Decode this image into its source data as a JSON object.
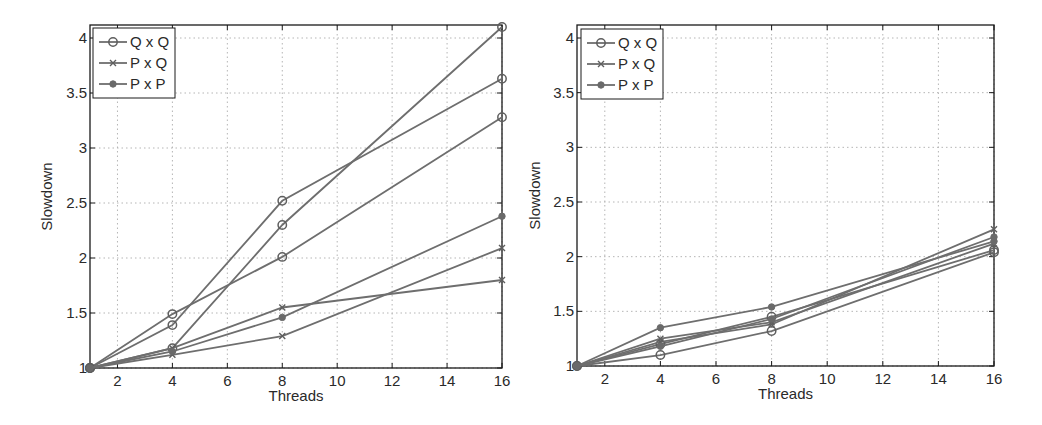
{
  "chart_data": [
    {
      "type": "line",
      "title": "",
      "xlabel": "Threads",
      "ylabel": "Slowdown",
      "xlim": [
        1,
        16
      ],
      "ylim": [
        1,
        4.12
      ],
      "grid": true,
      "legend_position": "upper left",
      "x": [
        1,
        4,
        8,
        16
      ],
      "xticks": [
        2,
        4,
        6,
        8,
        10,
        12,
        14,
        16
      ],
      "yticks": [
        1,
        1.5,
        2,
        2.5,
        3,
        3.5,
        4
      ],
      "xtick_labels": [
        "2",
        "4",
        "6",
        "8",
        "10",
        "12",
        "14",
        "16"
      ],
      "ytick_labels": [
        "1",
        "1.5",
        "2",
        "2.5",
        "3",
        "3.5",
        "4"
      ],
      "legend": [
        {
          "label": "Q x Q",
          "marker": "circle"
        },
        {
          "label": "P x Q",
          "marker": "x"
        },
        {
          "label": "P x P",
          "marker": "dot"
        }
      ],
      "series": [
        {
          "name": "Q x Q",
          "marker": "circle",
          "values": [
            1,
            1.18,
            2.3,
            4.1
          ]
        },
        {
          "name": "Q x Q",
          "marker": "circle",
          "values": [
            1,
            1.39,
            2.52,
            3.63
          ]
        },
        {
          "name": "Q x Q",
          "marker": "circle",
          "values": [
            1,
            1.49,
            2.01,
            3.28
          ]
        },
        {
          "name": "P x Q",
          "marker": "x",
          "values": [
            1,
            1.18,
            1.55,
            1.8
          ]
        },
        {
          "name": "P x Q",
          "marker": "x",
          "values": [
            1,
            1.12,
            1.29,
            2.09
          ]
        },
        {
          "name": "P x P",
          "marker": "dot",
          "values": [
            1,
            1.15,
            1.46,
            2.38
          ]
        }
      ]
    },
    {
      "type": "line",
      "title": "",
      "xlabel": "Threads",
      "ylabel": "Slowdown",
      "xlim": [
        1,
        16
      ],
      "ylim": [
        1,
        4.12
      ],
      "grid": true,
      "legend_position": "upper left",
      "x": [
        1,
        4,
        8,
        16
      ],
      "xticks": [
        2,
        4,
        6,
        8,
        10,
        12,
        14,
        16
      ],
      "yticks": [
        1,
        1.5,
        2,
        2.5,
        3,
        3.5,
        4
      ],
      "xtick_labels": [
        "2",
        "4",
        "6",
        "8",
        "10",
        "12",
        "14",
        "16"
      ],
      "ytick_labels": [
        "1",
        "1.5",
        "2",
        "2.5",
        "3",
        "3.5",
        "4"
      ],
      "legend": [
        {
          "label": "Q x Q",
          "marker": "circle"
        },
        {
          "label": "P x Q",
          "marker": "x"
        },
        {
          "label": "P x P",
          "marker": "dot"
        }
      ],
      "series": [
        {
          "name": "Q x Q",
          "marker": "circle",
          "values": [
            1,
            1.1,
            1.32,
            2.04
          ]
        },
        {
          "name": "Q x Q",
          "marker": "circle",
          "values": [
            1,
            1.2,
            1.45,
            2.06
          ]
        },
        {
          "name": "P x Q",
          "marker": "x",
          "values": [
            1,
            1.22,
            1.38,
            2.25
          ]
        },
        {
          "name": "P x Q",
          "marker": "x",
          "values": [
            1,
            1.25,
            1.4,
            2.12
          ]
        },
        {
          "name": "P x P",
          "marker": "dot",
          "values": [
            1,
            1.35,
            1.54,
            2.14
          ]
        },
        {
          "name": "P x P",
          "marker": "dot",
          "values": [
            1,
            1.18,
            1.43,
            2.18
          ]
        }
      ]
    }
  ]
}
